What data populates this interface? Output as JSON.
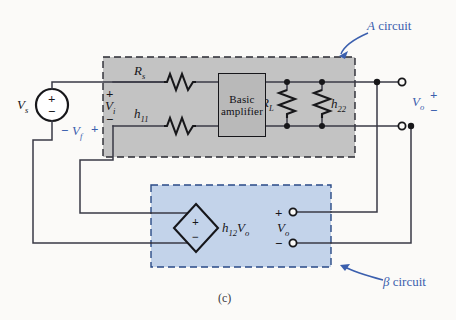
{
  "figure": {
    "caption": "(c)",
    "type": "circuit-diagram"
  },
  "colors": {
    "a_circuit_fill": "#c3c3c3",
    "beta_circuit_fill": "#c3d3ea",
    "annotation": "#3b5fae",
    "wire": "#3a3a46",
    "ink": "#17171a",
    "page": "#fbfaf8"
  },
  "annotations": {
    "a_circuit": {
      "symbol": "A",
      "text": " circuit"
    },
    "beta_circuit": {
      "symbol": "β",
      "text": " circuit"
    }
  },
  "source": {
    "label": "V",
    "sub": "s",
    "plus": "+",
    "minus": "−"
  },
  "feedback_voltage": {
    "minus": "−",
    "label": "V",
    "sub": "f",
    "plus": "+"
  },
  "input_voltage": {
    "plus": "+",
    "label": "V",
    "sub": "i",
    "minus": "−"
  },
  "a_circuit": {
    "series_resistor": {
      "label": "R",
      "sub": "s"
    },
    "h11_resistor": {
      "label": "h",
      "sub": "11"
    },
    "load_resistor": {
      "label": "R",
      "sub": "L"
    },
    "h22_resistor": {
      "label": "h",
      "sub": "22"
    },
    "amplifier": {
      "line1": "Basic",
      "line2": "amplifier"
    }
  },
  "beta_circuit": {
    "dependent_source": {
      "plus": "+",
      "minus": "−",
      "label": "h",
      "sub": "12",
      "label2": "V",
      "sub2": "o"
    },
    "port_voltage": {
      "plus": "+",
      "label": "V",
      "sub": "o",
      "minus": "−"
    }
  },
  "output": {
    "label": "V",
    "sub": "o",
    "plus": "+",
    "minus": "−"
  }
}
